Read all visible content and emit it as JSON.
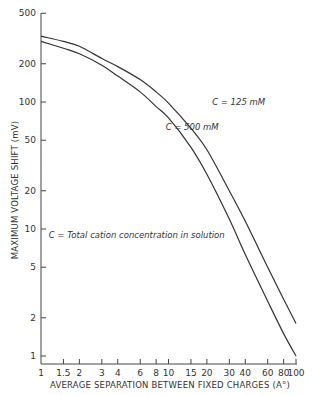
{
  "chart_data": {
    "type": "line",
    "title": "",
    "xlabel": "AVERAGE SEPARATION BETWEEN FIXED CHARGES (A°)",
    "ylabel": "MAXIMUM VOLTAGE SHIFT (mV)",
    "xscale": "log",
    "yscale": "log",
    "xlim": [
      1,
      100
    ],
    "ylim": [
      0.9,
      500
    ],
    "x_ticks": [
      1,
      1.5,
      2,
      3,
      4,
      6,
      8,
      10,
      15,
      20,
      30,
      40,
      60,
      80,
      100
    ],
    "x_tick_labels": [
      "1",
      "1.5",
      "2",
      "3",
      "4",
      "6",
      "8",
      "10",
      "15",
      "20",
      "30",
      "40",
      "60",
      "80",
      "100"
    ],
    "y_ticks": [
      1,
      2,
      5,
      10,
      20,
      50,
      100,
      200,
      500
    ],
    "y_tick_labels": [
      "1",
      "2",
      "5",
      "10",
      "20",
      "50",
      "100",
      "200",
      "500"
    ],
    "grid": false,
    "legend": "inline labels",
    "series": [
      {
        "name": "C = 125 mM",
        "x": [
          1,
          1.5,
          2,
          3,
          4,
          6,
          8,
          10,
          15,
          20,
          30,
          40,
          60,
          80,
          100
        ],
        "y": [
          330,
          300,
          275,
          220,
          190,
          150,
          120,
          98,
          62,
          42,
          20,
          11.5,
          5,
          2.8,
          1.8
        ]
      },
      {
        "name": "C = 500 mM",
        "x": [
          1,
          1.5,
          2,
          3,
          4,
          6,
          8,
          10,
          15,
          20,
          30,
          40,
          60,
          80,
          100
        ],
        "y": [
          300,
          265,
          240,
          195,
          160,
          120,
          92,
          75,
          44,
          27,
          12,
          6.3,
          2.7,
          1.5,
          1.0
        ]
      }
    ],
    "annotations": [
      {
        "text": "C = 125 mM",
        "x": 22,
        "y": 95
      },
      {
        "text": "C = 500 mM",
        "x": 9.5,
        "y": 60
      },
      {
        "text": "C = Total cation concentration in solution",
        "x": 1.15,
        "y": 8.5
      }
    ]
  }
}
